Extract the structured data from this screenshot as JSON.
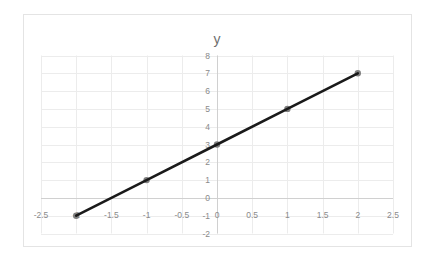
{
  "chart_data": {
    "type": "scatter",
    "title": "y",
    "xlabel": "",
    "ylabel": "",
    "x": [
      -2,
      -1,
      0,
      1,
      2
    ],
    "series": [
      {
        "name": "y",
        "values": [
          -1,
          1,
          3,
          5,
          7
        ],
        "line": true,
        "markers": true
      }
    ],
    "trend": "y = 2x + 3",
    "xlim": [
      -2.5,
      2.5
    ],
    "ylim": [
      -2,
      8
    ],
    "xticks": [
      "-2.5",
      "-2",
      "-1.5",
      "-1",
      "-0.5",
      "0",
      "0.5",
      "1",
      "1.5",
      "2",
      "2.5"
    ],
    "yticks": [
      "-2",
      "-1",
      "0",
      "1",
      "2",
      "3",
      "4",
      "5",
      "6",
      "7",
      "8"
    ],
    "grid": true,
    "legend": "none"
  },
  "style": {
    "line_color": "#1a1a1a",
    "marker_color": "#7f7f7f",
    "grid_color": "#ececec",
    "tick_color": "#8a8a8a",
    "title_color": "#6e6e6e"
  }
}
